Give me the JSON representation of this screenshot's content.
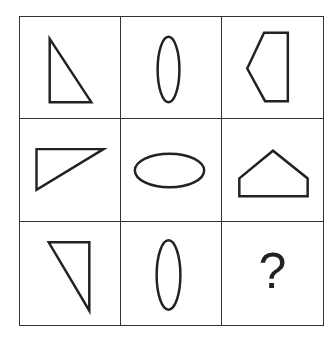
{
  "puzzle": {
    "rows": 3,
    "cols": 3,
    "stroke_color": "#222222",
    "cells": [
      {
        "row": 1,
        "col": 1,
        "shape": "right-triangle",
        "orientation": "right angle bottom-left, vertical leg left"
      },
      {
        "row": 1,
        "col": 2,
        "shape": "ellipse",
        "orientation": "vertical"
      },
      {
        "row": 1,
        "col": 3,
        "shape": "pentagon",
        "orientation": "point left"
      },
      {
        "row": 2,
        "col": 1,
        "shape": "right-triangle",
        "orientation": "right angle top-left, horizontal leg top"
      },
      {
        "row": 2,
        "col": 2,
        "shape": "ellipse",
        "orientation": "horizontal"
      },
      {
        "row": 2,
        "col": 3,
        "shape": "pentagon",
        "orientation": "point up"
      },
      {
        "row": 3,
        "col": 1,
        "shape": "right-triangle",
        "orientation": "right angle top-right, vertical leg right"
      },
      {
        "row": 3,
        "col": 2,
        "shape": "ellipse",
        "orientation": "vertical"
      },
      {
        "row": 3,
        "col": 3,
        "shape": "unknown",
        "label": "?"
      }
    ]
  }
}
